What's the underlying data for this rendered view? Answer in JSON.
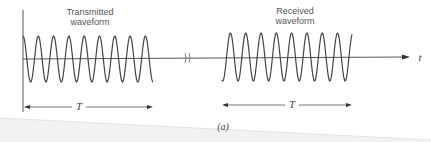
{
  "figure": {
    "caption": "(a)",
    "transmitted_label_line1": "Transmitted",
    "transmitted_label_line2": "waveform",
    "received_label_line1": "Received",
    "received_label_line2": "waveform",
    "time_axis_label": "t",
    "duration_label_left": "T",
    "duration_label_right": "T",
    "colors": {
      "line": "#444444",
      "axis": "#555555",
      "shade": "#e6e6e6"
    }
  }
}
